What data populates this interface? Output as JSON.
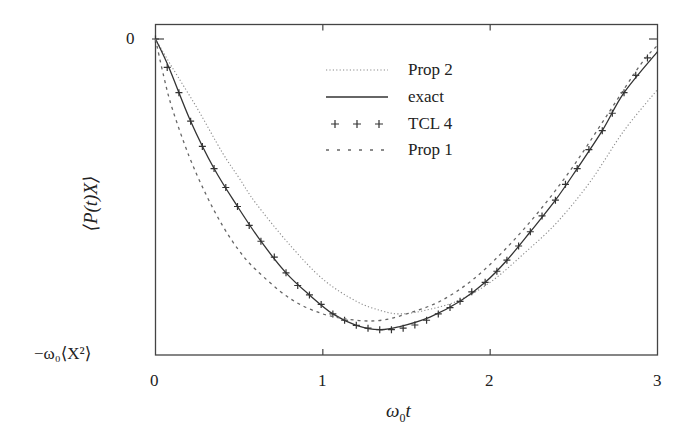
{
  "chart_data": {
    "type": "line",
    "title": "",
    "xlabel": "ω₀t",
    "ylabel": "⟨P(t)X⟩",
    "xlim": [
      0,
      3
    ],
    "ylim": [
      -1,
      0
    ],
    "x_ticks": [
      "0",
      "1",
      "2",
      "3"
    ],
    "y_ticks": [
      {
        "value": 0,
        "label": "0"
      },
      {
        "value": -1,
        "label": "−ω₀⟨X²⟩"
      }
    ],
    "grid": false,
    "legend_position": "upper center",
    "series": [
      {
        "name": "Prop 2",
        "style": "dotted",
        "color": "#888888",
        "x": [
          0,
          0.1,
          0.25,
          0.4,
          0.5,
          0.6,
          0.8,
          1.0,
          1.2,
          1.35,
          1.46,
          1.6,
          1.8,
          2.0,
          2.2,
          2.4,
          2.6,
          2.8,
          3.0
        ],
        "y": [
          0,
          -0.09,
          -0.22,
          -0.36,
          -0.44,
          -0.52,
          -0.65,
          -0.76,
          -0.83,
          -0.86,
          -0.87,
          -0.86,
          -0.83,
          -0.77,
          -0.68,
          -0.58,
          -0.45,
          -0.29,
          -0.16
        ]
      },
      {
        "name": "exact",
        "style": "solid",
        "color": "#333333",
        "x": [
          0,
          0.08,
          0.21,
          0.35,
          0.49,
          0.63,
          0.78,
          0.92,
          1.06,
          1.2,
          1.34,
          1.46,
          1.64,
          1.82,
          1.97,
          2.1,
          2.24,
          2.39,
          2.52,
          2.67,
          2.8,
          3.0
        ],
        "y": [
          0,
          -0.09,
          -0.26,
          -0.41,
          -0.53,
          -0.64,
          -0.74,
          -0.81,
          -0.87,
          -0.906,
          -0.92,
          -0.91,
          -0.88,
          -0.83,
          -0.77,
          -0.7,
          -0.61,
          -0.51,
          -0.41,
          -0.29,
          -0.17,
          -0.04
        ]
      },
      {
        "name": "TCL 4",
        "style": "plus-markers",
        "color": "#333333",
        "x": [
          0,
          0.07,
          0.14,
          0.21,
          0.28,
          0.35,
          0.42,
          0.49,
          0.56,
          0.63,
          0.71,
          0.78,
          0.85,
          0.92,
          0.99,
          1.06,
          1.13,
          1.2,
          1.27,
          1.34,
          1.41,
          1.48,
          1.55,
          1.62,
          1.69,
          1.76,
          1.82,
          1.89,
          1.97,
          2.04,
          2.1,
          2.17,
          2.24,
          2.31,
          2.39,
          2.45,
          2.52,
          2.59,
          2.67,
          2.73,
          2.8,
          2.87,
          2.94
        ],
        "y": [
          0,
          -0.09,
          -0.17,
          -0.26,
          -0.34,
          -0.41,
          -0.47,
          -0.53,
          -0.59,
          -0.64,
          -0.69,
          -0.74,
          -0.78,
          -0.81,
          -0.84,
          -0.87,
          -0.89,
          -0.906,
          -0.915,
          -0.92,
          -0.92,
          -0.915,
          -0.905,
          -0.89,
          -0.87,
          -0.85,
          -0.83,
          -0.8,
          -0.77,
          -0.735,
          -0.7,
          -0.655,
          -0.61,
          -0.56,
          -0.51,
          -0.46,
          -0.41,
          -0.35,
          -0.29,
          -0.235,
          -0.17,
          -0.115,
          -0.06
        ]
      },
      {
        "name": "Prop 1",
        "style": "dashed",
        "color": "#666666",
        "x": [
          0,
          0.05,
          0.1,
          0.2,
          0.3,
          0.4,
          0.5,
          0.6,
          0.8,
          1.0,
          1.2,
          1.35,
          1.5,
          1.7,
          1.9,
          2.1,
          2.3,
          2.5,
          2.7,
          2.9,
          3.0
        ],
        "y": [
          0,
          -0.12,
          -0.22,
          -0.37,
          -0.49,
          -0.59,
          -0.67,
          -0.73,
          -0.82,
          -0.87,
          -0.89,
          -0.89,
          -0.87,
          -0.83,
          -0.76,
          -0.66,
          -0.54,
          -0.4,
          -0.24,
          -0.08,
          -0.02
        ]
      }
    ]
  },
  "axes": {
    "x_label": "ω",
    "x_label_sub": "0",
    "x_label_tail": "t",
    "y_label": "⟨P(t)X⟩",
    "y_tick_top": "0",
    "y_tick_bottom": "−ω₀⟨X²⟩",
    "x_ticks": [
      "0",
      "1",
      "2",
      "3"
    ]
  },
  "legend": {
    "items": [
      {
        "label": "Prop  2",
        "style": "dotted"
      },
      {
        "label": "exact",
        "style": "solid"
      },
      {
        "label": "TCL 4",
        "style": "plus"
      },
      {
        "label": "Prop  1",
        "style": "dashed"
      }
    ]
  }
}
